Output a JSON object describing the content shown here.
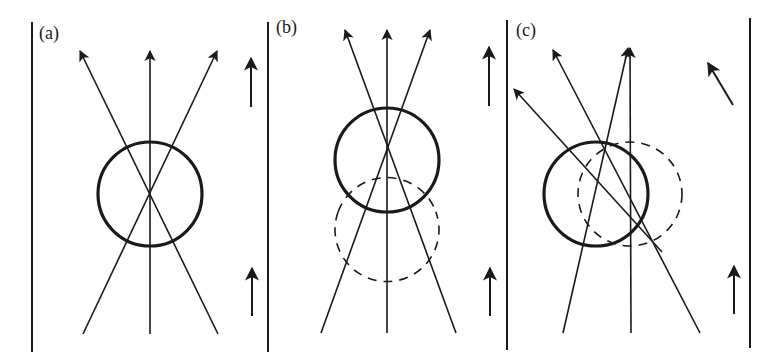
{
  "figure": {
    "colors": {
      "ink": "#1a1a1a",
      "background": "#ffffff"
    },
    "walls": [
      {
        "x": 32,
        "y1": 22,
        "y2": 352
      },
      {
        "x": 268,
        "y1": 22,
        "y2": 352
      },
      {
        "x": 507,
        "y1": 20,
        "y2": 350
      },
      {
        "x": 750,
        "y1": 18,
        "y2": 348
      }
    ],
    "panels": [
      {
        "id": "a",
        "label": "(a)",
        "label_pos": [
          39,
          39
        ],
        "lens": {
          "cx": 150,
          "cy": 194,
          "r": 52
        },
        "ghost": null,
        "rays": [
          {
            "x1": 83,
            "y1": 334,
            "x2": 217,
            "y2": 51
          },
          {
            "x1": 150,
            "y1": 334,
            "x2": 150,
            "y2": 51
          },
          {
            "x1": 218,
            "y1": 334,
            "x2": 80,
            "y2": 51
          }
        ],
        "flow_arrows": [
          {
            "x1": 251,
            "y1": 107,
            "x2": 251,
            "y2": 58
          },
          {
            "x1": 252,
            "y1": 316,
            "x2": 252,
            "y2": 268
          }
        ]
      },
      {
        "id": "b",
        "label": "(b)",
        "label_pos": [
          276,
          33
        ],
        "lens": {
          "cx": 387,
          "cy": 160,
          "r": 52
        },
        "ghost": {
          "cx": 387,
          "cy": 194,
          "r": 52,
          "start_deg": 200,
          "end_deg": 340
        },
        "rays": [
          {
            "x1": 321,
            "y1": 333,
            "x2": 430,
            "y2": 30
          },
          {
            "x1": 387,
            "y1": 333,
            "x2": 387,
            "y2": 30
          },
          {
            "x1": 456,
            "y1": 333,
            "x2": 345,
            "y2": 30
          }
        ],
        "flow_arrows": [
          {
            "x1": 489,
            "y1": 106,
            "x2": 489,
            "y2": 47
          },
          {
            "x1": 490,
            "y1": 316,
            "x2": 490,
            "y2": 268
          }
        ]
      },
      {
        "id": "c",
        "label": "(c)",
        "label_pos": [
          516,
          36
        ],
        "lens": {
          "cx": 596,
          "cy": 194,
          "r": 52
        },
        "ghost": {
          "cx": 630,
          "cy": 194,
          "r": 52
        },
        "rays": [
          {
            "x1": 563,
            "y1": 333,
            "x2": 628,
            "y2": 48
          },
          {
            "x1": 631,
            "y1": 333,
            "x2": 630,
            "y2": 48
          },
          {
            "x1": 700,
            "y1": 333,
            "x2": 553,
            "y2": 50
          },
          {
            "x1": 662,
            "y1": 252,
            "x2": 514,
            "y2": 89
          }
        ],
        "flow_arrows": [
          {
            "x1": 733,
            "y1": 105,
            "x2": 708,
            "y2": 63
          },
          {
            "x1": 734,
            "y1": 314,
            "x2": 734,
            "y2": 266
          }
        ]
      }
    ]
  }
}
